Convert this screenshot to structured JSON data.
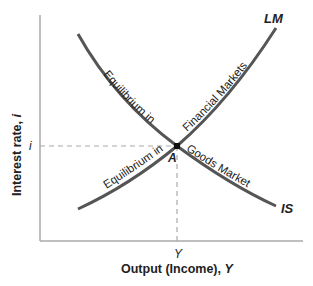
{
  "diagram": {
    "y_axis_label_prefix": "Interest rate, ",
    "y_axis_label_var": "i",
    "x_axis_label_prefix": "Output (Income), ",
    "x_axis_label_var": "Y",
    "y_tick": "i",
    "x_tick": "Y",
    "curves": {
      "lm": {
        "label": "LM",
        "caption": "Equilibrium in Financial Markets"
      },
      "is": {
        "label": "IS",
        "caption": "Equilibrium in Goods Market"
      }
    },
    "lm_text_1": "Equilibrium in",
    "lm_text_2": "Financial Markets",
    "is_text_1": "Equilibrium in",
    "is_text_2": "Goods Market",
    "point_label": "A",
    "colors": {
      "curve": "#555555",
      "axis": "#aaaaaa",
      "dash": "#aaaaaa",
      "point": "#111111"
    }
  }
}
